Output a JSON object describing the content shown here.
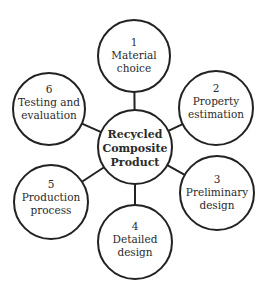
{
  "diagram": {
    "center": {
      "lines": [
        "Recycled",
        "Composite",
        "Product"
      ],
      "cx": 135,
      "cy": 147,
      "r": 37
    },
    "nodes": [
      {
        "number": "1",
        "lines": [
          "Material",
          "choice"
        ],
        "cx": 134,
        "cy": 56,
        "r": 36
      },
      {
        "number": "2",
        "lines": [
          "Property",
          "estimation"
        ],
        "cx": 216,
        "cy": 108,
        "r": 37
      },
      {
        "number": "3",
        "lines": [
          "Preliminary",
          "design"
        ],
        "cx": 217,
        "cy": 193,
        "r": 37
      },
      {
        "number": "4",
        "lines": [
          "Detailed",
          "design"
        ],
        "cx": 135,
        "cy": 242,
        "r": 37
      },
      {
        "number": "5",
        "lines": [
          "Production",
          "process"
        ],
        "cx": 51,
        "cy": 202,
        "r": 37
      },
      {
        "number": "6",
        "lines": [
          "Testing and",
          "evaluation"
        ],
        "cx": 49,
        "cy": 109,
        "r": 36
      }
    ],
    "colors": {
      "stroke": "#222222",
      "text": "#2b2b2b",
      "background": "#ffffff"
    }
  }
}
